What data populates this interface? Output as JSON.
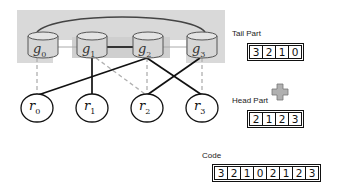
{
  "diagram": {
    "groups": [
      {
        "id": "g0",
        "base": "g",
        "sub": "0"
      },
      {
        "id": "g1",
        "base": "g",
        "sub": "1"
      },
      {
        "id": "g2",
        "base": "g",
        "sub": "2"
      },
      {
        "id": "g3",
        "base": "g",
        "sub": "3"
      }
    ],
    "nodes": [
      {
        "id": "r0",
        "base": "r",
        "sub": "0"
      },
      {
        "id": "r1",
        "base": "r",
        "sub": "1"
      },
      {
        "id": "r2",
        "base": "r",
        "sub": "2"
      },
      {
        "id": "r3",
        "base": "r",
        "sub": "3"
      }
    ],
    "solid_edges": [
      [
        "g1",
        "r1"
      ],
      [
        "g2",
        "r0"
      ],
      [
        "g2",
        "r3"
      ],
      [
        "g3",
        "r2"
      ]
    ],
    "dashed_edges": [
      [
        "g0",
        "r0"
      ],
      [
        "g1",
        "r2"
      ],
      [
        "g2",
        "r2"
      ],
      [
        "g3",
        "r3"
      ]
    ],
    "group_links": [
      [
        "g0",
        "g3"
      ],
      [
        "g1",
        "g2"
      ],
      [
        "g0",
        "g1"
      ],
      [
        "g2",
        "g3"
      ]
    ]
  },
  "tail": {
    "label": "Tail Part",
    "values": [
      "3",
      "2",
      "1",
      "0"
    ]
  },
  "plus_icon": {
    "color": "#999999"
  },
  "head": {
    "label": "Head Part",
    "values": [
      "2",
      "1",
      "2",
      "3"
    ]
  },
  "code": {
    "label": "Code",
    "values": [
      "3",
      "2",
      "1",
      "0",
      "2",
      "1",
      "2",
      "3"
    ]
  }
}
